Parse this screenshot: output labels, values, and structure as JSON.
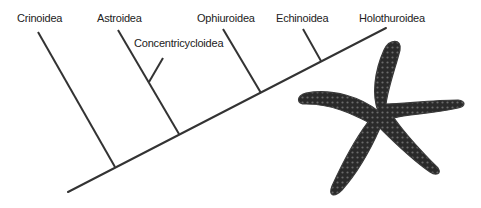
{
  "diagram": {
    "type": "cladogram",
    "line_color": "#333333",
    "taxa": [
      {
        "id": "crinoidea",
        "label": "Crinoidea"
      },
      {
        "id": "astroidea",
        "label": "Astroidea"
      },
      {
        "id": "concentricycloidea",
        "label": "Concentricycloidea"
      },
      {
        "id": "ophiuroidea",
        "label": "Ophiuroidea"
      },
      {
        "id": "echinoidea",
        "label": "Echinoidea"
      },
      {
        "id": "holothuroidea",
        "label": "Holothuroidea"
      }
    ],
    "illustration": {
      "name": "starfish",
      "color": "#2a2a2a"
    }
  }
}
